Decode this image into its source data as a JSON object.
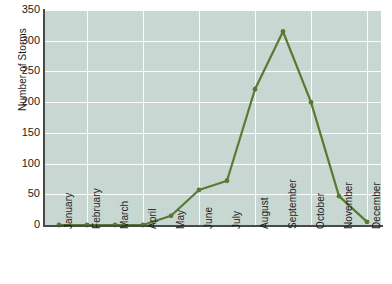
{
  "figure": {
    "background_color": "#ffffff",
    "plot_background_color": "#c7d7d1",
    "gridline_color": "#ffffff",
    "spine_color": "#4a4a4a",
    "series_color": "#5a7a33",
    "clipped_title": ""
  },
  "chart_data": {
    "type": "line",
    "title": "",
    "xlabel": "",
    "ylabel": "Number of Storms",
    "categories": [
      "January",
      "February",
      "March",
      "April",
      "May",
      "June",
      "July",
      "August",
      "September",
      "October",
      "November",
      "December"
    ],
    "values": [
      0,
      0,
      0,
      0,
      15,
      57,
      72,
      221,
      315,
      200,
      47,
      5
    ],
    "series": [
      {
        "name": "Number of Storms",
        "values": [
          0,
          0,
          0,
          0,
          15,
          57,
          72,
          221,
          315,
          200,
          47,
          5
        ]
      }
    ],
    "ylim": [
      0,
      350
    ],
    "yticks": [
      0,
      50,
      100,
      150,
      200,
      250,
      300,
      350
    ],
    "ytick_labels": [
      "0",
      "50",
      "100",
      "150",
      "200",
      "250",
      "300",
      "350"
    ],
    "grid": true,
    "grid_axis": "both",
    "legend": false,
    "legend_position": "none",
    "markers": true,
    "marker_style": "circle",
    "line_color": "#5a7a33",
    "vertical_gridline_categories": [
      "February",
      "April",
      "June",
      "August",
      "October",
      "December"
    ]
  }
}
